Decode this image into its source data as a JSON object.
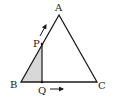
{
  "diagram": {
    "type": "geometry",
    "shape": "triangle ABC",
    "colors": {
      "stroke": "#1a1a1a",
      "shade": "#d8d8d8",
      "text": "#222222"
    },
    "points": {
      "A": {
        "label": "A",
        "x": 59,
        "y": 15
      },
      "B": {
        "label": "B",
        "x": 21,
        "y": 82
      },
      "C": {
        "label": "C",
        "x": 97,
        "y": 82
      },
      "P": {
        "label": "P",
        "x": 42,
        "y": 44
      },
      "Q": {
        "label": "Q",
        "x": 42,
        "y": 82
      }
    },
    "shaded_region": "triangle BQP",
    "arrows": [
      {
        "name": "p-moves-toward-a",
        "from": "P",
        "direction": "along BA toward A"
      },
      {
        "name": "q-moves-toward-c",
        "from": "Q",
        "direction": "along BC toward C"
      }
    ]
  }
}
